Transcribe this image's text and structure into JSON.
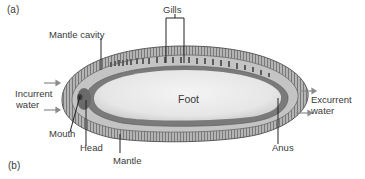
{
  "figure": {
    "panel_a_label": "(a)",
    "panel_b_label": "(b)",
    "labels": {
      "gills": "Gills",
      "mantle_cavity": "Mantle cavity",
      "incurrent_line1": "Incurrent",
      "incurrent_line2": "water",
      "excurrent_line1": "Excurrent",
      "excurrent_line2": "water",
      "foot": "Foot",
      "mouth": "Mouth",
      "head": "Head",
      "mantle": "Mantle",
      "anus": "Anus"
    },
    "colors": {
      "background": "#ffffff",
      "mantle_outer": "#a9a9a9",
      "mantle_inner": "#c8c8c8",
      "foot_fill": "#ececec",
      "tissue_dark": "#6e6e6e",
      "text": "#3a3a3a",
      "arrow": "#8c8c8c"
    }
  }
}
